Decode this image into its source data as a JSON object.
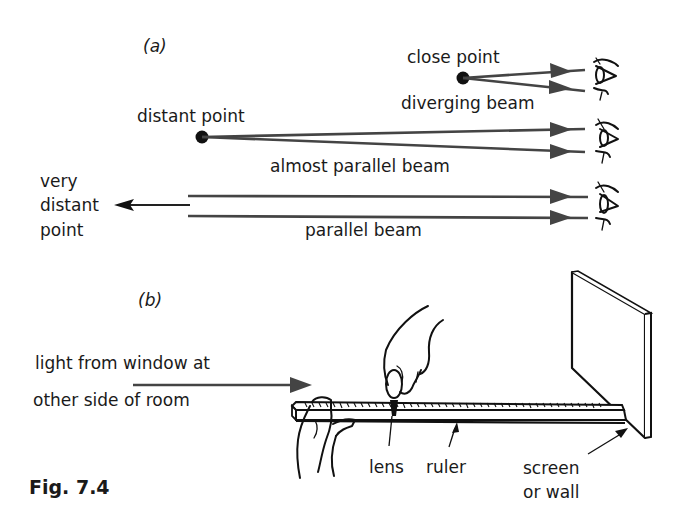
{
  "figure": {
    "label": "Fig. 7.4",
    "part_a": {
      "label": "(a)",
      "rows": [
        {
          "source_label": "close point",
          "beam_label": "diverging beam",
          "beam_type": "diverging"
        },
        {
          "source_label": "distant point",
          "beam_label": "almost parallel beam",
          "beam_type": "almost-parallel"
        },
        {
          "source_label_lines": [
            "very",
            "distant",
            "point"
          ],
          "beam_label": "parallel beam",
          "beam_type": "parallel"
        }
      ]
    },
    "part_b": {
      "label": "(b)",
      "light_label_lines": [
        "light from window at",
        "other side of room"
      ],
      "callouts": {
        "lens": "lens",
        "ruler": "ruler",
        "screen_lines": [
          "screen",
          "or wall"
        ]
      }
    },
    "colors": {
      "ray": "#444444",
      "ink": "#111111",
      "background": "#ffffff"
    }
  }
}
